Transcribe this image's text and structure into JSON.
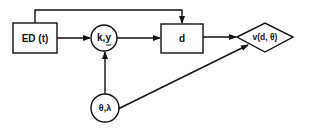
{
  "diagram": {
    "nodes": [
      {
        "id": "ed",
        "shape": "rectangle",
        "label": "ED (t)"
      },
      {
        "id": "ky",
        "shape": "circle",
        "label": "k,y",
        "underline": "y"
      },
      {
        "id": "d",
        "shape": "rectangle",
        "label": "d"
      },
      {
        "id": "v",
        "shape": "diamond",
        "label": "v(d, θ)"
      },
      {
        "id": "theta_lambda",
        "shape": "circle",
        "label": "θ,λ"
      }
    ],
    "edges": [
      {
        "from": "ed",
        "to": "ky"
      },
      {
        "from": "ed",
        "to": "d",
        "route": "over-top"
      },
      {
        "from": "ky",
        "to": "d"
      },
      {
        "from": "d",
        "to": "v"
      },
      {
        "from": "theta_lambda",
        "to": "ky"
      },
      {
        "from": "theta_lambda",
        "to": "v"
      }
    ],
    "colors": {
      "stroke": "#111111",
      "background": "#ffffff"
    }
  }
}
